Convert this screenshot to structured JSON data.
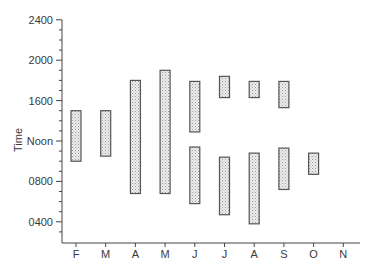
{
  "chart_data": {
    "type": "bar",
    "subtype": "floating-range",
    "title": "",
    "xlabel": "",
    "ylabel": "Time",
    "categories": [
      "F",
      "M",
      "A",
      "M",
      "J",
      "J",
      "A",
      "S",
      "O",
      "N"
    ],
    "y_ticks": [
      {
        "value": 4,
        "label": "0400"
      },
      {
        "value": 8,
        "label": "0800"
      },
      {
        "value": 12,
        "label": "Noon"
      },
      {
        "value": 16,
        "label": "1600"
      },
      {
        "value": 20,
        "label": "2000"
      },
      {
        "value": 24,
        "label": "2400"
      }
    ],
    "ylim": [
      2,
      24
    ],
    "grid": false,
    "legend": null,
    "series": [
      {
        "name": "time ranges (hours, 24h clock)",
        "ranges": [
          [
            [
              10.0,
              15.0
            ]
          ],
          [
            [
              10.5,
              15.0
            ]
          ],
          [
            [
              6.8,
              18.0
            ]
          ],
          [
            [
              6.8,
              19.0
            ]
          ],
          [
            [
              5.8,
              11.4
            ],
            [
              12.9,
              17.9
            ]
          ],
          [
            [
              4.7,
              10.4
            ],
            [
              16.3,
              18.4
            ]
          ],
          [
            [
              3.8,
              10.8
            ],
            [
              16.3,
              17.9
            ]
          ],
          [
            [
              7.2,
              11.3
            ],
            [
              15.3,
              17.9
            ]
          ],
          [
            [
              8.7,
              10.8
            ]
          ],
          []
        ]
      }
    ],
    "style": {
      "bar_fill": "#d9d9d9",
      "bar_stroke": "#555555",
      "axis_color": "#444444"
    }
  }
}
